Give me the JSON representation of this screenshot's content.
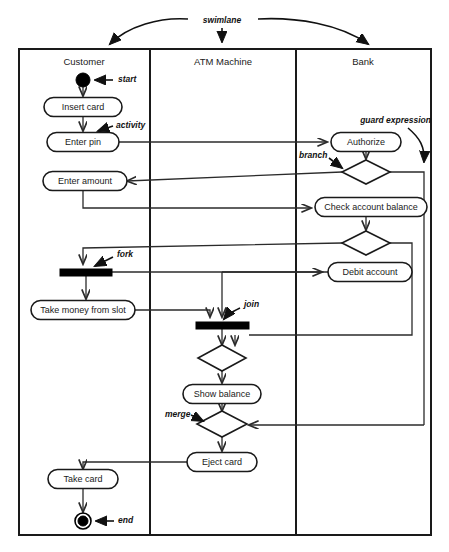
{
  "diagram": {
    "kind": "uml-activity-diagram",
    "colors": {
      "stroke": "#1a1a1a",
      "flow": "#2b2b2b",
      "fill": "#ffffff",
      "node": "#000000",
      "background": "#ffffff"
    }
  },
  "swimlane_note": {
    "label": "swimlane"
  },
  "lanes": [
    {
      "id": "customer",
      "title": "Customer",
      "x": 19,
      "width": 131
    },
    {
      "id": "atm",
      "title": "ATM Machine",
      "x": 150,
      "width": 146
    },
    {
      "id": "bank",
      "title": "Bank",
      "x": 296,
      "width": 135
    }
  ],
  "activities": [
    {
      "id": "insert-card",
      "label": "Insert card",
      "lane": "customer",
      "cx": 83,
      "cy": 107,
      "w": 78,
      "h": 19
    },
    {
      "id": "enter-pin",
      "label": "Enter pin",
      "lane": "customer",
      "cx": 83,
      "cy": 142,
      "w": 72,
      "h": 19
    },
    {
      "id": "enter-amount",
      "label": "Enter amount",
      "lane": "customer",
      "cx": 83,
      "cy": 181,
      "w": 80,
      "h": 19
    },
    {
      "id": "take-money",
      "label": "Take money from slot",
      "lane": "customer",
      "cx": 83,
      "cy": 310,
      "w": 104,
      "h": 19
    },
    {
      "id": "take-card",
      "label": "Take card",
      "lane": "customer",
      "cx": 83,
      "cy": 479,
      "w": 70,
      "h": 19
    },
    {
      "id": "show-balance",
      "label": "Show balance",
      "lane": "atm",
      "cx": 222,
      "cy": 394,
      "w": 78,
      "h": 19
    },
    {
      "id": "eject-card",
      "label": "Eject card",
      "lane": "atm",
      "cx": 222,
      "cy": 462,
      "w": 70,
      "h": 19
    },
    {
      "id": "authorize",
      "label": "Authorize",
      "lane": "bank",
      "cx": 366,
      "cy": 142,
      "w": 70,
      "h": 19
    },
    {
      "id": "check-balance",
      "label": "Check account balance",
      "lane": "bank",
      "cx": 370,
      "cy": 207,
      "w": 110,
      "h": 19
    },
    {
      "id": "debit-account",
      "label": "Debit account",
      "lane": "bank",
      "cx": 370,
      "cy": 272,
      "w": 84,
      "h": 19
    }
  ],
  "decisions": [
    {
      "id": "branch-authorize",
      "lane": "bank",
      "cx": 366,
      "cy": 172,
      "rx": 24,
      "ry": 12
    },
    {
      "id": "branch-balance",
      "lane": "bank",
      "cx": 366,
      "cy": 243,
      "rx": 24,
      "ry": 12
    },
    {
      "id": "decision-join",
      "lane": "atm",
      "cx": 222,
      "cy": 358,
      "rx": 24,
      "ry": 13
    },
    {
      "id": "merge-eject",
      "lane": "atm",
      "cx": 222,
      "cy": 424,
      "rx": 25,
      "ry": 13
    }
  ],
  "bars": [
    {
      "id": "fork-bar",
      "lane": "customer",
      "x": 60,
      "y": 269,
      "w": 52,
      "h": 7
    },
    {
      "id": "join-bar",
      "lane": "atm",
      "x": 196,
      "y": 322,
      "w": 53,
      "h": 7
    }
  ],
  "terminals": [
    {
      "id": "start-node",
      "lane": "customer",
      "cx": 83,
      "cy": 80,
      "type": "initial"
    },
    {
      "id": "end-node",
      "lane": "customer",
      "cx": 83,
      "cy": 521,
      "type": "final"
    }
  ],
  "annotations": [
    {
      "id": "note-start",
      "label": "start",
      "x": 118,
      "y": 80,
      "align": "start"
    },
    {
      "id": "note-activity",
      "label": "activity",
      "x": 116,
      "y": 127,
      "align": "start"
    },
    {
      "id": "note-guard",
      "label": "guard expression",
      "x": 431,
      "y": 121,
      "align": "end"
    },
    {
      "id": "note-branch",
      "label": "branch",
      "x": 299,
      "y": 156,
      "align": "start"
    },
    {
      "id": "note-fork",
      "label": "fork",
      "x": 117,
      "y": 255,
      "align": "start"
    },
    {
      "id": "note-join",
      "label": "join",
      "x": 244,
      "y": 305,
      "align": "start"
    },
    {
      "id": "note-merge",
      "label": "merge",
      "x": 165,
      "y": 415,
      "align": "start"
    },
    {
      "id": "note-end",
      "label": "end",
      "x": 118,
      "y": 521,
      "align": "start"
    }
  ]
}
